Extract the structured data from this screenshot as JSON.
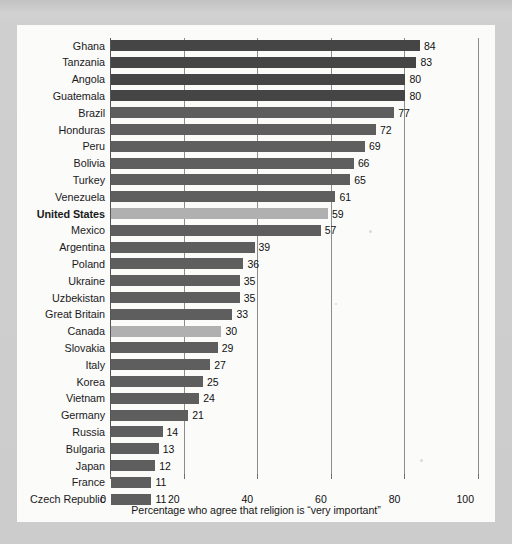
{
  "chart_data": {
    "type": "bar",
    "orientation": "horizontal",
    "title": "",
    "xlabel": "Percentage who agree that religion is “very important”",
    "ylabel": "",
    "xlim": [
      0,
      100
    ],
    "xticks": [
      0,
      20,
      40,
      60,
      80,
      100
    ],
    "grid": true,
    "legend": null,
    "categories": [
      "Ghana",
      "Tanzania",
      "Angola",
      "Guatemala",
      "Brazil",
      "Honduras",
      "Peru",
      "Bolivia",
      "Turkey",
      "Venezuela",
      "United States",
      "Mexico",
      "Argentina",
      "Poland",
      "Ukraine",
      "Uzbekistan",
      "Great Britain",
      "Canada",
      "Slovakia",
      "Italy",
      "Korea",
      "Vietnam",
      "Germany",
      "Russia",
      "Bulgaria",
      "Japan",
      "France",
      "Czech Republic"
    ],
    "values": [
      84,
      83,
      80,
      80,
      77,
      72,
      69,
      66,
      65,
      61,
      59,
      57,
      39,
      36,
      35,
      35,
      33,
      30,
      29,
      27,
      25,
      24,
      21,
      14,
      13,
      12,
      11,
      11
    ],
    "highlighted": [
      "United States",
      "Canada"
    ],
    "bold_labels": [
      "United States"
    ]
  },
  "colors": {
    "bar_dark": "#454545",
    "bar_mid": "#5b5b5b",
    "bar_highlight": "#b0b0b0",
    "gridline": "#8c8c8c",
    "axis": "#555555",
    "card_background": "#fbfbfa",
    "page_background": "#c9c9c9",
    "text": "#1a1a1a"
  },
  "caption": "Percentage who agree that religion is “very important”"
}
